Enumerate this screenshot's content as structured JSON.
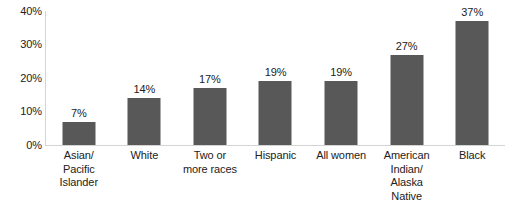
{
  "chart_data": {
    "type": "bar",
    "title": "",
    "subtitle": "",
    "xlabel": "",
    "ylabel": "",
    "categories": [
      "Asian/ Pacific Islander",
      "White",
      "Two or more races",
      "Hispanic",
      "All women",
      "American Indian/ Alaska Native",
      "Black"
    ],
    "values": [
      7,
      14,
      17,
      19,
      19,
      27,
      37
    ],
    "value_labels": [
      "7%",
      "14%",
      "17%",
      "19%",
      "19%",
      "27%",
      "37%"
    ],
    "ylim": [
      0,
      40
    ],
    "yticks": [
      0,
      10,
      20,
      30,
      40
    ],
    "ytick_labels": [
      "0%",
      "10%",
      "20%",
      "30%",
      "40%"
    ],
    "grid": false,
    "legend": null,
    "legend_position": "none",
    "bar_color": "#585858",
    "axis_color": "#d4d4d4",
    "text_color": "#222222"
  },
  "axis": {
    "y_ticks": [
      {
        "label": "40%",
        "value": 40
      },
      {
        "label": "30%",
        "value": 30
      },
      {
        "label": "20%",
        "value": 20
      },
      {
        "label": "10%",
        "value": 10
      },
      {
        "label": "0%",
        "value": 0
      }
    ]
  },
  "bars": [
    {
      "value": 7,
      "value_label": "7%",
      "category_lines": [
        "Asian/",
        "Pacific",
        "Islander"
      ]
    },
    {
      "value": 14,
      "value_label": "14%",
      "category_lines": [
        "White"
      ]
    },
    {
      "value": 17,
      "value_label": "17%",
      "category_lines": [
        "Two or",
        "more races"
      ]
    },
    {
      "value": 19,
      "value_label": "19%",
      "category_lines": [
        "Hispanic"
      ]
    },
    {
      "value": 19,
      "value_label": "19%",
      "category_lines": [
        "All women"
      ]
    },
    {
      "value": 27,
      "value_label": "27%",
      "category_lines": [
        "American",
        "Indian/",
        "Alaska",
        "Native"
      ]
    },
    {
      "value": 37,
      "value_label": "37%",
      "category_lines": [
        "Black"
      ]
    }
  ]
}
